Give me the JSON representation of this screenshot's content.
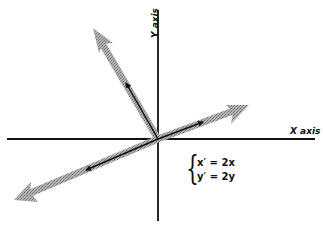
{
  "diagram": {
    "type": "vector transformation (uniform scaling)",
    "labels": {
      "x_axis": "X axis",
      "y_axis": "Y axis"
    },
    "equations": {
      "line1": "x′ = 2x",
      "line2": "y′ = 2y"
    },
    "colors": {
      "axis": "#111111",
      "original_vector": "#111111",
      "scaled_vector": "#9a9a9a"
    },
    "origin": [
      158,
      139
    ],
    "vectors": [
      {
        "name": "up-left",
        "original_tip": [
          126,
          83
        ],
        "scaled_tip": [
          93,
          28
        ]
      },
      {
        "name": "right",
        "original_tip": [
          203,
          122
        ],
        "scaled_tip": [
          249,
          105
        ]
      },
      {
        "name": "down-left",
        "original_tip": [
          86,
          170
        ],
        "scaled_tip": [
          14,
          200
        ]
      }
    ]
  }
}
